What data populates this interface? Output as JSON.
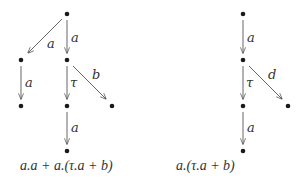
{
  "diagrams": [
    {
      "formula": "a.a + a.(τ.a + b)",
      "nodes": [
        {
          "id": "r",
          "x": 67,
          "y": 14
        },
        {
          "id": "l1",
          "x": 21,
          "y": 60
        },
        {
          "id": "m1",
          "x": 67,
          "y": 60
        },
        {
          "id": "l2",
          "x": 21,
          "y": 106
        },
        {
          "id": "m2",
          "x": 67,
          "y": 106
        },
        {
          "id": "rt",
          "x": 112,
          "y": 106
        },
        {
          "id": "m3",
          "x": 67,
          "y": 151
        }
      ],
      "edges": [
        {
          "from": "r",
          "to": "l1",
          "label": "a"
        },
        {
          "from": "r",
          "to": "m1",
          "label": "a"
        },
        {
          "from": "l1",
          "to": "l2",
          "label": "a"
        },
        {
          "from": "m1",
          "to": "m2",
          "label": "τ"
        },
        {
          "from": "m1",
          "to": "rt",
          "label": "b"
        },
        {
          "from": "m2",
          "to": "m3",
          "label": "a"
        }
      ]
    },
    {
      "formula": "a.(τ.a + b)",
      "nodes": [
        {
          "id": "r",
          "x": 243,
          "y": 14
        },
        {
          "id": "m1",
          "x": 243,
          "y": 60
        },
        {
          "id": "m2",
          "x": 243,
          "y": 106
        },
        {
          "id": "rt",
          "x": 288,
          "y": 106
        },
        {
          "id": "m3",
          "x": 243,
          "y": 151
        }
      ],
      "edges": [
        {
          "from": "r",
          "to": "m1",
          "label": "a"
        },
        {
          "from": "m1",
          "to": "m2",
          "label": "τ"
        },
        {
          "from": "m1",
          "to": "rt",
          "label": "d"
        },
        {
          "from": "m2",
          "to": "m3",
          "label": "a"
        }
      ]
    }
  ],
  "labels": {
    "left": {
      "e1": "a",
      "e2": "a",
      "e3": "a",
      "e4": "τ",
      "e5": "b",
      "e6": "a"
    },
    "right": {
      "e1": "a",
      "e2": "τ",
      "e3": "d",
      "e4": "a"
    }
  }
}
